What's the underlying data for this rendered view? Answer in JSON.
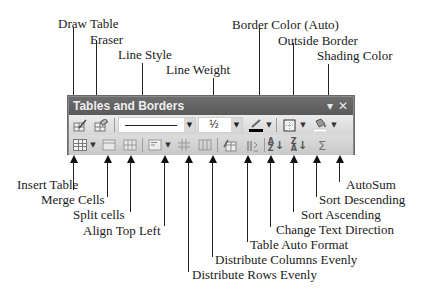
{
  "toolbar": {
    "title": "Tables and Borders",
    "close_glyph": "✕",
    "menu_glyph": "▾",
    "line_weight_value": "½",
    "row1": [
      {
        "name": "draw-table",
        "icon": "pencil-table-icon"
      },
      {
        "name": "eraser",
        "icon": "eraser-icon"
      },
      {
        "name": "line-style",
        "icon": "line-style-combo"
      },
      {
        "name": "line-weight",
        "icon": "line-weight-combo"
      },
      {
        "name": "border-color",
        "icon": "pen-color-icon"
      },
      {
        "name": "outside-border",
        "icon": "border-grid-icon"
      },
      {
        "name": "shading-color",
        "icon": "paint-bucket-icon"
      }
    ],
    "row2": [
      {
        "name": "insert-table",
        "icon": "table-grid-icon"
      },
      {
        "name": "merge-cells",
        "icon": "merge-icon"
      },
      {
        "name": "split-cells",
        "icon": "split-icon"
      },
      {
        "name": "align-top-left",
        "icon": "align-icon"
      },
      {
        "name": "distribute-rows",
        "icon": "distribute-rows-icon"
      },
      {
        "name": "distribute-columns",
        "icon": "distribute-columns-icon"
      },
      {
        "name": "table-auto-format",
        "icon": "autoformat-icon"
      },
      {
        "name": "change-text-direction",
        "icon": "text-direction-icon"
      },
      {
        "name": "sort-ascending",
        "icon": "sort-az-icon",
        "glyph": "A↓Z"
      },
      {
        "name": "sort-descending",
        "icon": "sort-za-icon",
        "glyph": "Z↓A"
      },
      {
        "name": "autosum",
        "icon": "sigma-icon",
        "glyph": "Σ"
      }
    ]
  },
  "labels_top": {
    "draw_table": "Draw Table",
    "eraser": "Eraser",
    "line_style": "Line Style",
    "line_weight": "Line Weight",
    "border_color": "Border Color (Auto)",
    "outside_border": "Outside Border",
    "shading_color": "Shading Color"
  },
  "labels_bottom": {
    "insert_table": "Insert Table",
    "merge_cells": "Merge Cells",
    "split_cells": "Split cells",
    "align_top_left": "Align Top Left",
    "distribute_rows": "Distribute Rows Evenly",
    "distribute_columns": "Distribute Columns Evenly",
    "table_auto_format": "Table Auto Format",
    "change_text_direction": "Change Text Direction",
    "sort_ascending": "Sort Ascending",
    "sort_descending": "Sort Descending",
    "autosum": "AutoSum"
  },
  "colors": {
    "titlebar": "#5f5f5f",
    "toolbar_bg": "#e2e2e2",
    "frame": "#8a8a8a",
    "shading_swatch": "#ffffff",
    "border_color_swatch": "#000000"
  }
}
